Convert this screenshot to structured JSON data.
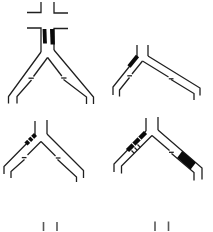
{
  "canvas": {
    "width": "213",
    "height": "231",
    "background": "#ffffff"
  },
  "palette": {
    "line": "#1f1f1f",
    "mark_fill": "#0a0a0a",
    "hatch_gap": "#ffffff",
    "faded_line": "#585858"
  },
  "figures": [
    {
      "id": "junction-top-left",
      "kind": "y-junction",
      "marks": "crossroad stubs above stem, two solid bars inside stem, joint ticks on inner branch lines"
    },
    {
      "id": "junction-top-right",
      "kind": "y-junction",
      "marks": "solid parallelogram on upper left branch, joint ticks on inner branch lines"
    },
    {
      "id": "junction-middle-left",
      "kind": "y-junction",
      "marks": "striped hatched band on upper left branch, joint ticks on inner branch lines"
    },
    {
      "id": "junction-middle-right",
      "kind": "y-junction",
      "marks": "hatched band with ticks on left branch, solid filled band on lower right branch"
    },
    {
      "id": "partial-figure-bottom-left",
      "kind": "cut-off stem stubs"
    },
    {
      "id": "partial-figure-bottom-right",
      "kind": "cut-off stem stubs"
    }
  ]
}
